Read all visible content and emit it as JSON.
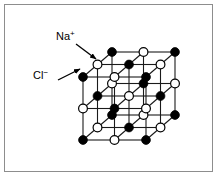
{
  "figure": {
    "kind": "crystal-lattice-diagram",
    "width": 218,
    "height": 177,
    "background_color": "#ffffff",
    "border_color": "#8d8d8d"
  },
  "labels": {
    "cation": {
      "name": "Na",
      "charge": "+",
      "full": "Na+",
      "ion_style": "open-circle",
      "x": 56,
      "y": 40
    },
    "anion": {
      "name": "Cl",
      "charge": "−",
      "full": "Cl-",
      "ion_style": "filled-circle",
      "x": 33,
      "y": 79
    }
  },
  "leader_lines": [
    {
      "name": "na-arrow",
      "from_x": 76,
      "from_y": 44,
      "to_x": 96,
      "to_y": 59,
      "points_to": "open-circle"
    },
    {
      "name": "cl-arrow",
      "from_x": 58,
      "from_y": 80,
      "to_x": 80,
      "to_y": 69,
      "points_to": "filled-circle"
    }
  ],
  "lattice": {
    "grid_size": 3,
    "line_color": "#1a1a1a",
    "line_width": 1.1,
    "node_radius": 4.4,
    "filled_color": "#000000",
    "open_color": "#ffffff",
    "open_stroke": "#000000",
    "origin_x": 83,
    "origin_y": 140,
    "axis_x": [
      31.5,
      0
    ],
    "axis_y": [
      0,
      -31.5
    ],
    "axis_z": [
      14.5,
      -12.5
    ],
    "parity_rule": "filled when (i+j+k) is even, open when odd",
    "filled_species": "Cl-",
    "open_species": "Na+"
  }
}
